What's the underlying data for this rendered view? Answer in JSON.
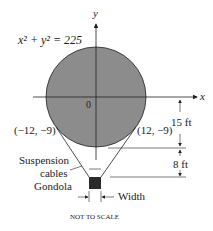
{
  "diagram": {
    "equation": "x² + y² = 225",
    "axis_x_label": "x",
    "axis_y_label": "y",
    "origin_label": "0",
    "point_left": "(−12, −9)",
    "point_right": "(12, −9)",
    "dim_upper": "15 ft",
    "dim_lower": "8 ft",
    "cables_label_1": "Suspension",
    "cables_label_2": "cables",
    "gondola_label": "Gondola",
    "width_label": "Width",
    "footer": "NOT TO SCALE",
    "colors": {
      "balloon_fill": "#8c8c8c",
      "gondola_fill": "#2a2a2a",
      "stroke": "#222222"
    }
  }
}
